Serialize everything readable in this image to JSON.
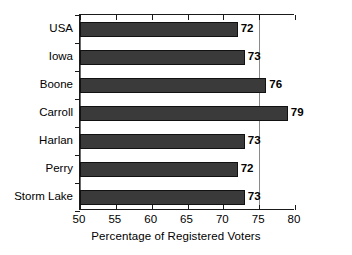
{
  "chart_data": {
    "type": "bar",
    "orientation": "horizontal",
    "title": "",
    "subtitle": "",
    "xlabel": "Percentage of Registered Voters",
    "ylabel": "",
    "categories": [
      "USA",
      "Iowa",
      "Boone",
      "Carroll",
      "Harlan",
      "Perry",
      "Storm Lake"
    ],
    "values": [
      72,
      73,
      76,
      79,
      73,
      72,
      73
    ],
    "value_labels": [
      "72",
      "73",
      "76",
      "79",
      "73",
      "72",
      "73"
    ],
    "xlim": [
      50,
      80
    ],
    "xticks": [
      50,
      55,
      60,
      65,
      70,
      75,
      80
    ],
    "xtick_labels": [
      "50",
      "55",
      "60",
      "65",
      "70",
      "75",
      "80"
    ],
    "grid": {
      "vertical": true,
      "vertical_at": [
        75
      ],
      "horizontal": false
    },
    "legend": {
      "visible": false,
      "position": "none",
      "entries": []
    },
    "annotations": [],
    "colors": {
      "bar_fill": "#3a3a3a",
      "bar_edge": "#111111",
      "background": "#ffffff",
      "axis": "#1a1a1a",
      "gridline": "#8a8a8a",
      "text": "#000000"
    }
  }
}
